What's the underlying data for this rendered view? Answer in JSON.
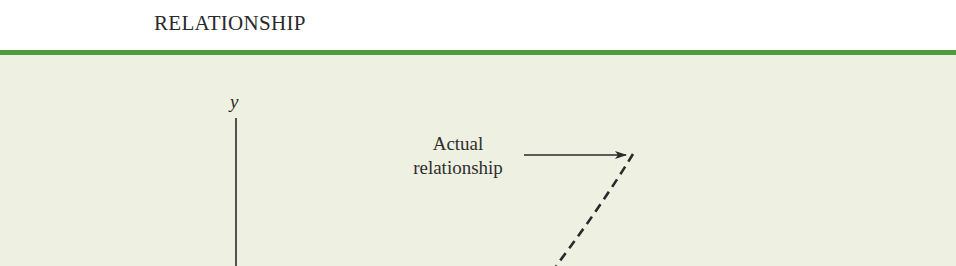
{
  "header": {
    "title": "RELATIONSHIP"
  },
  "colors": {
    "accent_rule": "#4e9a3f",
    "panel_background": "#eef1e2",
    "ink": "#2a2a2a"
  },
  "figure": {
    "y_axis_label": "y",
    "annotation": {
      "line1": "Actual",
      "line2": "relationship"
    },
    "elements": {
      "y_axis": {
        "x": 236,
        "y_top": 118,
        "y_bottom": 266
      },
      "arrow": {
        "x1": 524,
        "y1": 155,
        "x2": 626,
        "y2": 155
      },
      "dashed_curve": {
        "x_top": 633,
        "y_top": 154,
        "x_bottom": 556,
        "y_bottom": 266,
        "style": "dashed"
      }
    }
  }
}
